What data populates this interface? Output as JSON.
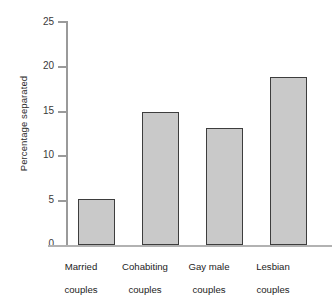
{
  "chart_data": {
    "type": "bar",
    "title": "",
    "xlabel": "",
    "ylabel": "Percentage separated",
    "categories": [
      "Married couples",
      "Cohabiting couples",
      "Gay male couples",
      "Lesbian couples"
    ],
    "category_lines": [
      [
        "Married",
        "couples"
      ],
      [
        "Cohabiting",
        "couples"
      ],
      [
        "Gay male",
        "couples"
      ],
      [
        "Lesbian",
        "couples"
      ]
    ],
    "values": [
      5.1,
      14.8,
      13.1,
      18.8
    ],
    "ylim": [
      0,
      25
    ],
    "yticks": [
      0,
      5,
      10,
      15,
      20,
      25
    ],
    "ytick_labels": [
      "0",
      "5",
      "10",
      "15",
      "20",
      "25"
    ],
    "grid": false,
    "legend": false,
    "bar_fill_color": "#c9c9c9",
    "bar_border_color": "#3d3d3d",
    "background_color": "#ffffff",
    "axis_color": "#9a9a9a"
  }
}
